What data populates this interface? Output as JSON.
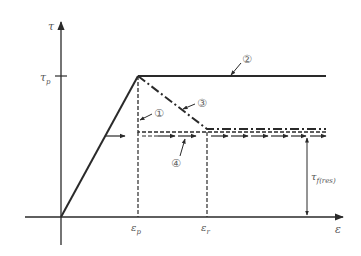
{
  "figure": {
    "axes": {
      "y_label": "τ",
      "x_label": "ε",
      "y_ticks": [
        {
          "label": "τ",
          "sub": "p"
        }
      ],
      "x_ticks": [
        {
          "label": "ε",
          "sub": "p"
        },
        {
          "label": "ε",
          "sub": "r"
        }
      ]
    },
    "annotations": {
      "residual_label": "τ",
      "residual_sub": "f(res)"
    },
    "curves": [
      {
        "id": "1",
        "marker": "①",
        "style": "dashed",
        "description": "drop at ε_p to residual level"
      },
      {
        "id": "2",
        "marker": "②",
        "style": "solid",
        "description": "perfectly plastic at τ_p"
      },
      {
        "id": "3",
        "marker": "③",
        "style": "dash-dot",
        "description": "linear softening from ε_p to ε_r"
      },
      {
        "id": "4",
        "marker": "④",
        "style": "dashed-arrow",
        "description": "residual plateau"
      }
    ],
    "colors": {
      "line": "#2a2a2a",
      "text": "#555555"
    }
  }
}
